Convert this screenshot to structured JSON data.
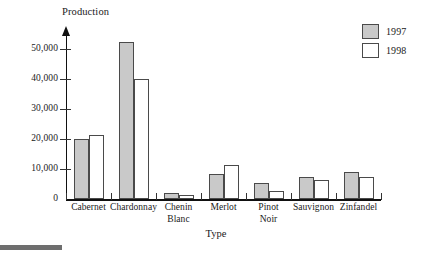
{
  "chart_data": {
    "type": "bar",
    "title": "",
    "ylabel": "Production",
    "xlabel": "Type",
    "categories": [
      "Cabernet",
      "Chardonnay",
      "Chenin Blanc",
      "Merlot",
      "Pinot Noir",
      "Sauvignon",
      "Zinfandel"
    ],
    "category_lines": [
      [
        "Cabernet"
      ],
      [
        "Chardonnay"
      ],
      [
        "Chenin",
        "Blanc"
      ],
      [
        "Merlot"
      ],
      [
        "Pinot",
        "Noir"
      ],
      [
        "Sauvignon"
      ],
      [
        "Zinfandel"
      ]
    ],
    "series": [
      {
        "name": "1997",
        "color": "#c9c9c9",
        "values": [
          20000,
          52500,
          2000,
          8200,
          5500,
          7200,
          9000
        ]
      },
      {
        "name": "1998",
        "color": "#ffffff",
        "values": [
          21500,
          40000,
          1200,
          11500,
          2700,
          6300,
          7500
        ]
      }
    ],
    "ylim": [
      0,
      55000
    ],
    "yticks": [
      0,
      10000,
      20000,
      30000,
      40000,
      50000
    ],
    "ytick_labels": [
      "0",
      "10,000",
      "20,000",
      "30,000",
      "40,000",
      "50,000"
    ],
    "grid": false,
    "legend_position": "top-right"
  },
  "legend": {
    "entries": [
      {
        "label": "1997"
      },
      {
        "label": "1998"
      }
    ]
  }
}
